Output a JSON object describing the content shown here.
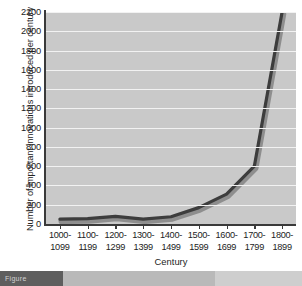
{
  "chart_data": {
    "type": "line",
    "title": "",
    "subtitle": "",
    "xlabel": "Century",
    "ylabel": "Number of important innovations introduced per century",
    "categories": [
      "1000-1099",
      "1100-1199",
      "1200-1299",
      "1300-1399",
      "1400-1499",
      "1500-1599",
      "1600-1699",
      "1700-1799",
      "1800-1899"
    ],
    "category_lines": [
      [
        "1000-",
        "1099"
      ],
      [
        "1100-",
        "1199"
      ],
      [
        "1200-",
        "1299"
      ],
      [
        "1300-",
        "1399"
      ],
      [
        "1400-",
        "1499"
      ],
      [
        "1500-",
        "1599"
      ],
      [
        "1600-",
        "1699"
      ],
      [
        "1700-",
        "1799"
      ],
      [
        "1800-",
        "1899"
      ]
    ],
    "values": [
      50,
      55,
      80,
      50,
      75,
      170,
      310,
      600,
      2200
    ],
    "series": [
      {
        "name": "Important innovations",
        "values": [
          50,
          55,
          80,
          50,
          75,
          170,
          310,
          600,
          2200
        ]
      }
    ],
    "ylim": [
      0,
      2200
    ],
    "yticks": [
      0,
      200,
      400,
      600,
      800,
      1000,
      1200,
      1400,
      1600,
      1800,
      2000,
      2200
    ],
    "ytick_labels": [
      "0",
      "200",
      "400",
      "600",
      "800",
      "1000",
      "1200",
      "1400",
      "1600",
      "1800",
      "2000",
      "2200"
    ],
    "grid": true,
    "grid_axis": "y",
    "legend": false,
    "legend_position": "none",
    "plot_background": "#c9c9c9",
    "grid_color": "#f2f2f2",
    "line_color": "#3d3d3d",
    "line_shadow_color": "#8e8e8e",
    "axis_color": "#3a3a3a",
    "text_color": "#232323",
    "figure_background": "#ffffff"
  },
  "caption_strip": {
    "label": "Figure",
    "dark_band_color": "#5e5e5e",
    "mid_band_color": "#b9b9b9",
    "right_band_color": "#cecece"
  }
}
